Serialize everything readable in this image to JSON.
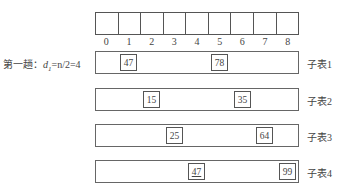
{
  "array": {
    "cell_count": 9,
    "indices": [
      "0",
      "1",
      "2",
      "3",
      "4",
      "5",
      "6",
      "7",
      "8"
    ]
  },
  "pass": {
    "label_prefix": "第一趟：",
    "d_symbol": "d",
    "d_sub": "1",
    "formula": "=n/2=4"
  },
  "sublists": [
    {
      "label": "子表1",
      "items": [
        {
          "value": "47",
          "index": 1,
          "underline": false
        },
        {
          "value": "78",
          "index": 5,
          "underline": false
        }
      ]
    },
    {
      "label": "子表2",
      "items": [
        {
          "value": "15",
          "index": 2,
          "underline": false
        },
        {
          "value": "35",
          "index": 6,
          "underline": false
        }
      ]
    },
    {
      "label": "子表3",
      "items": [
        {
          "value": "25",
          "index": 3,
          "underline": false
        },
        {
          "value": "64",
          "index": 7,
          "underline": false
        }
      ]
    },
    {
      "label": "子表4",
      "items": [
        {
          "value": "47",
          "index": 4,
          "underline": true
        },
        {
          "value": "99",
          "index": 8,
          "underline": false
        }
      ]
    }
  ]
}
